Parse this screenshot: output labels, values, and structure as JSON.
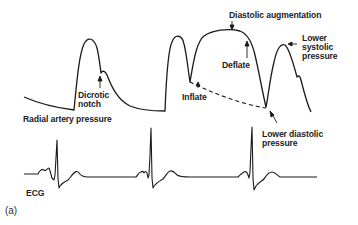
{
  "figure": {
    "panel_label": "(a)",
    "colors": {
      "line": "#1a1a1a",
      "text": "#222222",
      "background": "#ffffff"
    }
  },
  "arterial_trace": {
    "title": "Radial artery pressure",
    "annotations": {
      "dicrotic_notch": [
        "Dicrotic",
        "notch"
      ],
      "diastolic_augmentation": "Diastolic augmentation",
      "deflate": "Deflate",
      "inflate": "Inflate",
      "lower_systolic_pressure": [
        "Lower",
        "systolic",
        "pressure"
      ],
      "lower_diastolic_pressure": [
        "Lower diastolic",
        "pressure"
      ]
    }
  },
  "ecg_trace": {
    "title": "ECG"
  }
}
